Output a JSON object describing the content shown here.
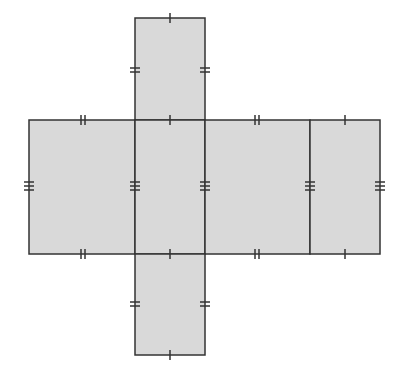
{
  "diagram": {
    "type": "net-of-rectangular-prism",
    "colors": {
      "fill": "#d9d9d9",
      "stroke": "#333333",
      "background": "#ffffff"
    },
    "faces": [
      {
        "id": "top",
        "x": 135,
        "y": 18,
        "w": 70,
        "h": 102
      },
      {
        "id": "left",
        "x": 29,
        "y": 120,
        "w": 106,
        "h": 134
      },
      {
        "id": "front",
        "x": 135,
        "y": 120,
        "w": 70,
        "h": 134
      },
      {
        "id": "right",
        "x": 205,
        "y": 120,
        "w": 105,
        "h": 134
      },
      {
        "id": "back",
        "x": 310,
        "y": 120,
        "w": 70,
        "h": 134
      },
      {
        "id": "bottom",
        "x": 135,
        "y": 254,
        "w": 70,
        "h": 101
      }
    ],
    "tick_marks": {
      "single": "edge of length a (70)",
      "double": "edge of length b (~103)",
      "triple": "edge of length c (134)"
    }
  }
}
